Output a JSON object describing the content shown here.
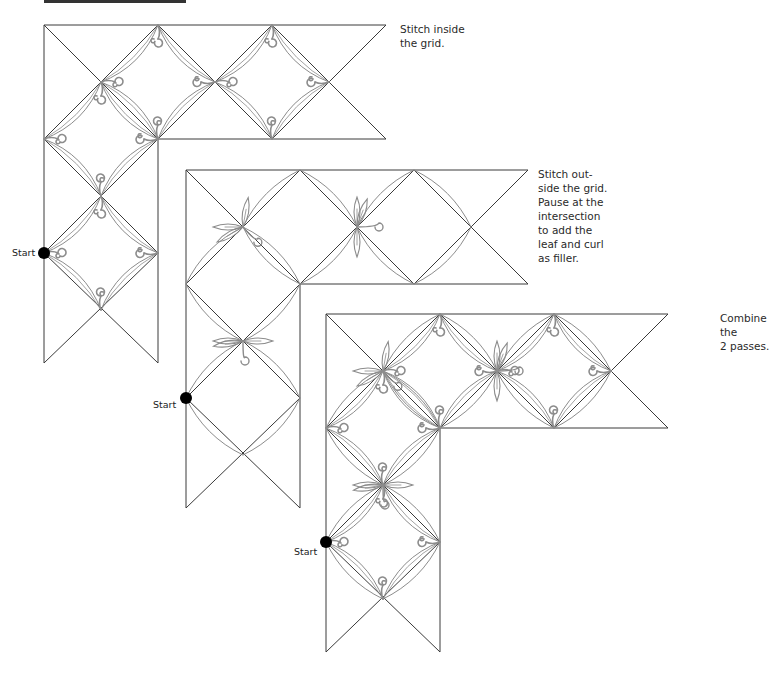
{
  "header_bar": {
    "color": "#333333"
  },
  "colors": {
    "grid": "#3a3a3a",
    "stitch": "#8c8c8c",
    "start_dot": "#000000"
  },
  "diagrams": [
    {
      "id": "inside-grid",
      "caption": "Stitch inside\nthe grid.",
      "caption_pos": [
        400,
        22
      ],
      "origin": [
        44,
        25
      ],
      "start_label": "Start",
      "start_point": [
        44,
        253
      ],
      "start_label_pos": [
        12,
        247
      ],
      "pass": "inside"
    },
    {
      "id": "outside-grid",
      "caption": "Stitch out-\nside the grid.\nPause at the\nintersection\nto add the\nleaf and curl\nas filler.",
      "caption_pos": [
        538,
        167
      ],
      "origin": [
        186,
        170
      ],
      "start_label": "Start",
      "start_point": [
        186,
        398
      ],
      "start_label_pos": [
        153,
        399
      ],
      "pass": "outside"
    },
    {
      "id": "combined",
      "caption": "Combine the\n2 passes.",
      "caption_pos": [
        720,
        311
      ],
      "origin": [
        326,
        314
      ],
      "start_label": "Start",
      "start_point": [
        326,
        542
      ],
      "start_label_pos": [
        294,
        546
      ],
      "pass": "both"
    }
  ],
  "grid": {
    "step": 57,
    "columns": 6,
    "rows": 6
  }
}
